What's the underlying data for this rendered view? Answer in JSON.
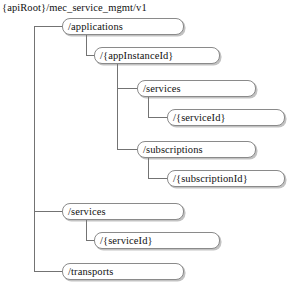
{
  "diagram": {
    "title": "{apiRoot}/mec_service_mgmt/v1",
    "type": "resource-uri-tree",
    "line_color": "#737373",
    "box_border_color": "#8a8a8a",
    "box_fill_color": "#ffffff",
    "text_color": "#111111",
    "nodes": [
      {
        "id": "applications",
        "label": "/applications",
        "depth": 1,
        "x": 62,
        "y": 18,
        "w": 122,
        "h": 17
      },
      {
        "id": "appInstanceId",
        "label": "/{appInstanceId}",
        "depth": 2,
        "x": 94,
        "y": 47,
        "w": 126,
        "h": 17
      },
      {
        "id": "services",
        "label": "/services",
        "depth": 3,
        "x": 137,
        "y": 80,
        "w": 119,
        "h": 17
      },
      {
        "id": "serviceId",
        "label": "/{serviceId}",
        "depth": 4,
        "x": 167,
        "y": 109,
        "w": 118,
        "h": 17
      },
      {
        "id": "subscriptions",
        "label": "/subscriptions",
        "depth": 3,
        "x": 137,
        "y": 141,
        "w": 119,
        "h": 17
      },
      {
        "id": "subscriptionId",
        "label": "/{subscriptionId}",
        "depth": 4,
        "x": 167,
        "y": 170,
        "w": 118,
        "h": 17
      },
      {
        "id": "services-root",
        "label": "/services",
        "depth": 1,
        "x": 62,
        "y": 203,
        "w": 122,
        "h": 17
      },
      {
        "id": "serviceId-root",
        "label": "/{serviceId}",
        "depth": 2,
        "x": 94,
        "y": 232,
        "w": 126,
        "h": 17
      },
      {
        "id": "transports",
        "label": "/transports",
        "depth": 1,
        "x": 62,
        "y": 263,
        "w": 122,
        "h": 17
      }
    ],
    "connectors": [
      {
        "from": "root",
        "to": "applications",
        "trunk_x": 34,
        "y": 26
      },
      {
        "from": "root",
        "to": "services-root",
        "trunk_x": 34,
        "y": 211
      },
      {
        "from": "root",
        "to": "transports",
        "trunk_x": 34,
        "y": 271
      },
      {
        "from": "applications",
        "to": "appInstanceId",
        "trunk_x": 86,
        "y": 55
      },
      {
        "from": "appInstanceId",
        "to": "services",
        "trunk_x": 117,
        "y": 88
      },
      {
        "from": "appInstanceId",
        "to": "subscriptions",
        "trunk_x": 117,
        "y": 149
      },
      {
        "from": "services",
        "to": "serviceId",
        "trunk_x": 148,
        "y": 117
      },
      {
        "from": "subscriptions",
        "to": "subscriptionId",
        "trunk_x": 148,
        "y": 178
      },
      {
        "from": "services-root",
        "to": "serviceId-root",
        "trunk_x": 86,
        "y": 240
      }
    ]
  }
}
